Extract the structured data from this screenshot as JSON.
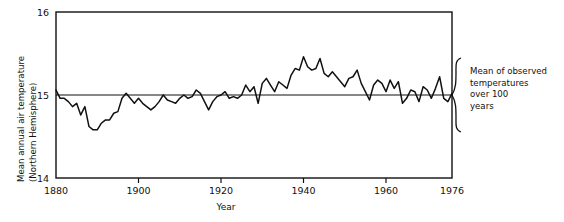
{
  "chart_data": {
    "type": "line",
    "title": "",
    "xlabel": "Year",
    "ylabel_line1": "Mean annual air temperature",
    "ylabel_line2": "(Northern Hemisphere)",
    "xlim": [
      1880,
      1976
    ],
    "ylim": [
      14,
      16
    ],
    "xticks": [
      1880,
      1900,
      1920,
      1940,
      1960,
      1976
    ],
    "xtick_labels": [
      "1880",
      "1900",
      "1920",
      "1940",
      "1960",
      "1976"
    ],
    "yticks": [
      14,
      15,
      16
    ],
    "ytick_labels": [
      "14",
      "15",
      "16"
    ],
    "grid": false,
    "legend": "none",
    "reference_line": {
      "value": 15,
      "label_line1": "Mean of observed",
      "label_line2": "temperatures",
      "label_line3": "over 100",
      "label_line4": "years"
    },
    "series": [
      {
        "name": "Mean annual air temperature (Northern Hemisphere)",
        "color": "#111111",
        "x": [
          1880,
          1881,
          1882,
          1883,
          1884,
          1885,
          1886,
          1887,
          1888,
          1889,
          1890,
          1891,
          1892,
          1893,
          1894,
          1895,
          1896,
          1897,
          1898,
          1899,
          1900,
          1901,
          1902,
          1903,
          1904,
          1905,
          1906,
          1907,
          1908,
          1909,
          1910,
          1911,
          1912,
          1913,
          1914,
          1915,
          1916,
          1917,
          1918,
          1919,
          1920,
          1921,
          1922,
          1923,
          1924,
          1925,
          1926,
          1927,
          1928,
          1929,
          1930,
          1931,
          1932,
          1933,
          1934,
          1935,
          1936,
          1937,
          1938,
          1939,
          1940,
          1941,
          1942,
          1943,
          1944,
          1945,
          1946,
          1947,
          1948,
          1949,
          1950,
          1951,
          1952,
          1953,
          1954,
          1955,
          1956,
          1957,
          1958,
          1959,
          1960,
          1961,
          1962,
          1963,
          1964,
          1965,
          1966,
          1967,
          1968,
          1969,
          1970,
          1971,
          1972,
          1973,
          1974,
          1975,
          1976
        ],
        "values": [
          15.06,
          14.96,
          14.96,
          14.92,
          14.86,
          14.9,
          14.76,
          14.86,
          14.62,
          14.58,
          14.58,
          14.66,
          14.7,
          14.7,
          14.78,
          14.8,
          14.96,
          15.02,
          14.96,
          14.9,
          14.96,
          14.9,
          14.86,
          14.82,
          14.86,
          14.92,
          15.0,
          14.94,
          14.92,
          14.9,
          14.96,
          15.0,
          14.96,
          14.98,
          15.06,
          15.02,
          14.92,
          14.82,
          14.92,
          14.98,
          15.0,
          15.04,
          14.96,
          14.98,
          14.96,
          15.0,
          15.12,
          15.04,
          15.1,
          14.9,
          15.14,
          15.2,
          15.12,
          15.04,
          15.16,
          15.12,
          15.08,
          15.24,
          15.32,
          15.3,
          15.46,
          15.34,
          15.3,
          15.32,
          15.44,
          15.26,
          15.22,
          15.28,
          15.22,
          15.16,
          15.1,
          15.2,
          15.22,
          15.3,
          15.14,
          15.04,
          14.94,
          15.12,
          15.18,
          15.14,
          15.04,
          15.18,
          15.08,
          15.16,
          14.9,
          14.96,
          15.06,
          15.04,
          14.92,
          15.1,
          15.06,
          14.96,
          15.08,
          15.22,
          14.96,
          14.92,
          15.02
        ]
      }
    ]
  }
}
